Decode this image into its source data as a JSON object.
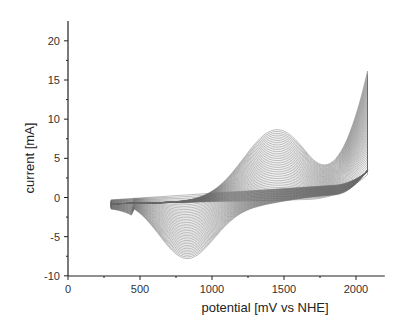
{
  "chart_data": {
    "type": "line",
    "title": "",
    "xlabel": "potential [mV vs NHE]",
    "ylabel": "current [mA]",
    "xlim": [
      0,
      2200
    ],
    "ylim": [
      -10,
      22
    ],
    "x_ticks": [
      0,
      500,
      1000,
      1500,
      2000
    ],
    "y_ticks": [
      -10,
      -5,
      0,
      5,
      10,
      15,
      20
    ],
    "grid": false,
    "legend": null,
    "envelope": {
      "anodic_outer": {
        "x": [
          300,
          500,
          700,
          900,
          1100,
          1300,
          1450,
          1600,
          1700,
          1800,
          1950,
          2080
        ],
        "y": [
          -0.5,
          -0.3,
          0.5,
          2.5,
          6.0,
          8.8,
          9.5,
          8.8,
          8.0,
          9.5,
          14.0,
          18.3
        ]
      },
      "cathodic_outer": {
        "x": [
          2080,
          1900,
          1700,
          1500,
          1300,
          1100,
          900,
          800,
          650,
          500,
          300
        ],
        "y": [
          2.5,
          0.5,
          -0.3,
          -1.0,
          -2.5,
          -5.0,
          -7.5,
          -7.8,
          -5.5,
          -2.5,
          -2.0
        ]
      },
      "baseline_cycle": {
        "x": [
          300,
          700,
          1200,
          1600,
          1800,
          2080
        ],
        "y": [
          -0.8,
          -0.5,
          0.0,
          1.0,
          2.0,
          3.5
        ]
      }
    },
    "colors": {
      "curves": "#666666",
      "axis": "#222222"
    }
  }
}
